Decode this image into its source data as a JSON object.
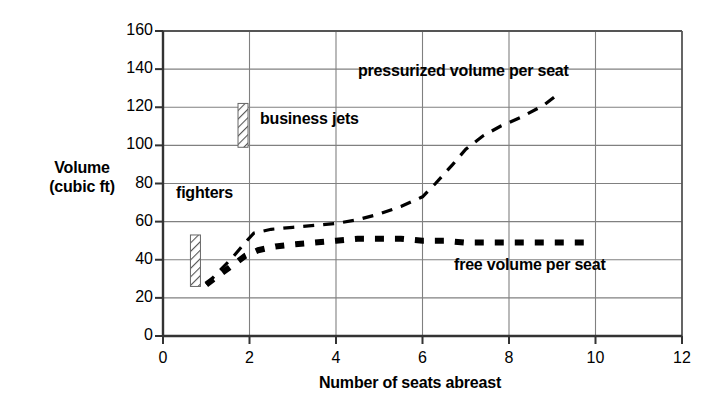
{
  "chart_data": {
    "type": "line",
    "title": "",
    "xlabel": "Number of seats abreast",
    "ylabel": "Volume (cubic ft)",
    "ylabel_line1": "Volume",
    "ylabel_line2": "(cubic ft)",
    "xlim": [
      0,
      12
    ],
    "ylim": [
      0,
      160
    ],
    "xticks": [
      0,
      2,
      4,
      6,
      8,
      10,
      12
    ],
    "yticks": [
      0,
      20,
      40,
      60,
      80,
      100,
      120,
      140,
      160
    ],
    "xtick_labels": [
      "0",
      "2",
      "4",
      "6",
      "8",
      "10",
      "12"
    ],
    "ytick_labels": [
      "0",
      "20",
      "40",
      "60",
      "80",
      "100",
      "120",
      "140",
      "160"
    ],
    "grid": "horizontal-and-vertical",
    "grid_color": "#808080",
    "line_color": "#000000",
    "legend_position": "inline-annotations",
    "series": [
      {
        "name": "pressurized volume per seat",
        "style": "dashed",
        "label_x": 6.6,
        "label_y": 140,
        "points": [
          [
            1.0,
            27
          ],
          [
            1.3,
            34
          ],
          [
            1.6,
            41
          ],
          [
            1.9,
            49
          ],
          [
            2.1,
            54
          ],
          [
            2.5,
            56
          ],
          [
            3.0,
            57
          ],
          [
            3.5,
            58
          ],
          [
            4.0,
            59
          ],
          [
            4.5,
            61
          ],
          [
            5.0,
            64
          ],
          [
            5.5,
            68
          ],
          [
            6.0,
            73
          ],
          [
            6.3,
            80
          ],
          [
            6.7,
            90
          ],
          [
            7.0,
            98
          ],
          [
            7.4,
            105
          ],
          [
            7.8,
            110
          ],
          [
            8.3,
            115
          ],
          [
            8.8,
            121
          ],
          [
            9.2,
            128
          ]
        ]
      },
      {
        "name": "free volume per seat",
        "style": "thick-dashed",
        "label_x": 6.8,
        "label_y": 39,
        "points": [
          [
            1.0,
            27
          ],
          [
            1.3,
            32
          ],
          [
            1.6,
            37
          ],
          [
            1.9,
            42
          ],
          [
            2.2,
            45
          ],
          [
            2.6,
            47
          ],
          [
            3.0,
            48
          ],
          [
            3.5,
            49
          ],
          [
            4.0,
            50
          ],
          [
            4.5,
            51
          ],
          [
            5.0,
            51
          ],
          [
            5.5,
            51
          ],
          [
            6.0,
            50
          ],
          [
            6.5,
            50
          ],
          [
            7.0,
            49
          ],
          [
            7.5,
            49
          ],
          [
            8.0,
            49
          ],
          [
            8.5,
            49
          ],
          [
            9.0,
            49
          ],
          [
            9.5,
            49
          ],
          [
            9.9,
            49
          ]
        ]
      }
    ],
    "ranges": [
      {
        "name": "business jets",
        "x": 1.85,
        "y_low": 99,
        "y_high": 122,
        "hatch": "diagonal",
        "label": "business jets"
      },
      {
        "name": "fighters",
        "x": 0.75,
        "y_low": 26,
        "y_high": 53,
        "hatch": "diagonal",
        "label": "fighters"
      }
    ],
    "annotations": [
      {
        "id": "pressurized",
        "text": "pressurized volume per seat"
      },
      {
        "id": "business",
        "text": "business jets"
      },
      {
        "id": "fighters",
        "text": "fighters"
      },
      {
        "id": "free",
        "text": "free volume per seat"
      }
    ]
  },
  "axes": {
    "x_title": "Number of seats abreast",
    "y_title_line1": "Volume",
    "y_title_line2": "(cubic ft)"
  },
  "annotations": {
    "pressurized": "pressurized volume per seat",
    "business_jets": "business jets",
    "fighters": "fighters",
    "free_volume": "free volume per seat"
  }
}
